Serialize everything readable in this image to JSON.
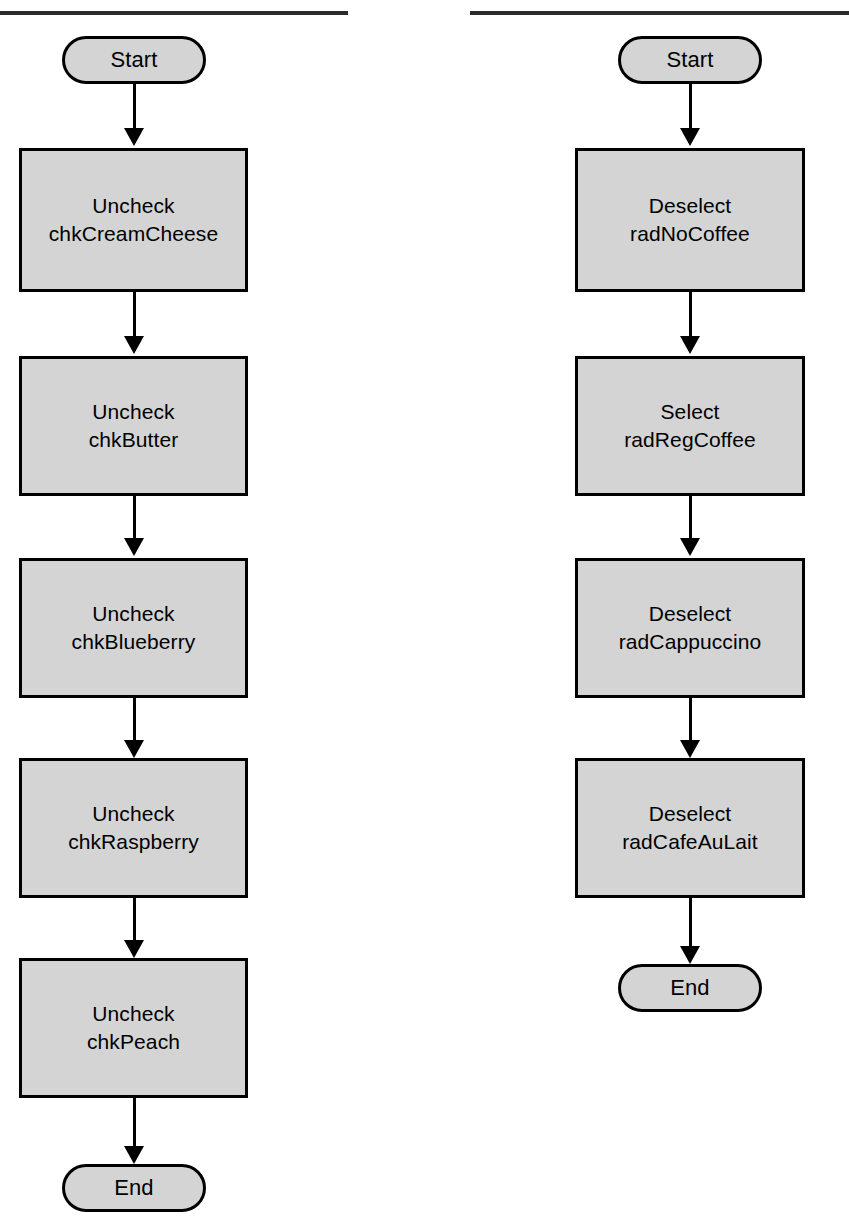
{
  "page": {
    "width": 849,
    "height": 1232,
    "background": "#ffffff",
    "node_fill": "#d4d4d4",
    "node_stroke": "#000000",
    "rule_color": "#2b2b2b"
  },
  "flowcharts": [
    {
      "id": "checkbox-reset-flow",
      "column": "left",
      "start_label": "Start",
      "end_label": "End",
      "steps": [
        {
          "action": "Uncheck",
          "target": "chkCreamCheese"
        },
        {
          "action": "Uncheck",
          "target": "chkButter"
        },
        {
          "action": "Uncheck",
          "target": "chkBlueberry"
        },
        {
          "action": "Uncheck",
          "target": "chkRaspberry"
        },
        {
          "action": "Uncheck",
          "target": "chkPeach"
        }
      ]
    },
    {
      "id": "radio-reset-flow",
      "column": "right",
      "start_label": "Start",
      "end_label": "End",
      "steps": [
        {
          "action": "Deselect",
          "target": "radNoCoffee"
        },
        {
          "action": "Select",
          "target": "radRegCoffee"
        },
        {
          "action": "Deselect",
          "target": "radCappuccino"
        },
        {
          "action": "Deselect",
          "target": "radCafeAuLait"
        }
      ]
    }
  ]
}
